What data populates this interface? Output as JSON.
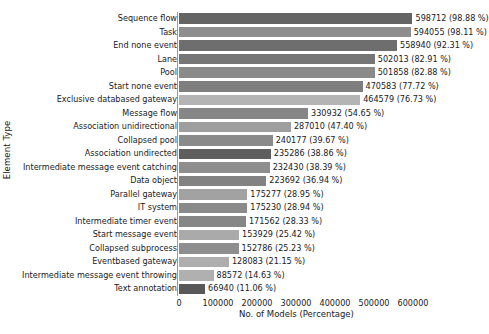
{
  "chart_data": {
    "type": "bar",
    "orientation": "horizontal",
    "title": "",
    "xlabel": "No. of Models (Percentage)",
    "ylabel": "Element Type",
    "xlim": [
      0,
      640000
    ],
    "xticks": [
      0,
      100000,
      200000,
      300000,
      400000,
      500000,
      600000
    ],
    "xticklabels": [
      "0",
      "100000",
      "200000",
      "300000",
      "400000",
      "500000",
      "600000"
    ],
    "grid": false,
    "legend": false,
    "categories": [
      "Sequence flow",
      "Task",
      "End none event",
      "Lane",
      "Pool",
      "Start none event",
      "Exclusive  databased  gateway",
      "Message flow",
      "Association  unidirectional",
      "Collapsed pool",
      "Association  undirected",
      "Intermediate message event catching",
      "Data object",
      "Parallel gateway",
      "IT system",
      "Intermediate timer event",
      "Start message event",
      "Collapsed subprocess",
      "Eventbased gateway",
      "Intermediate message event throwing",
      "Text annotation"
    ],
    "values": [
      598712,
      594055,
      558940,
      502013,
      501858,
      470583,
      464579,
      330932,
      287010,
      240177,
      235286,
      232430,
      223692,
      175277,
      175230,
      171562,
      153929,
      152786,
      128083,
      88572,
      66940
    ],
    "percentages": [
      98.88,
      98.11,
      92.31,
      82.91,
      82.88,
      77.72,
      76.73,
      54.65,
      47.4,
      39.67,
      38.86,
      38.39,
      36.94,
      28.95,
      28.94,
      28.33,
      25.42,
      25.23,
      21.15,
      14.63,
      11.06
    ],
    "data_labels": [
      "598712 (98.88 %)",
      "594055 (98.11 %)",
      "558940 (92.31 %)",
      "502013 (82.91 %)",
      "501858 (82.88 %)",
      "470583 (77.72 %)",
      "464579 (76.73 %)",
      "330932 (54.65 %)",
      "287010 (47.40 %)",
      "240177 (39.67 %)",
      "235286 (38.86 %)",
      "232430 (38.39 %)",
      "223692 (36.94 %)",
      "175277 (28.95 %)",
      "175230 (28.94 %)",
      "171562 (28.33 %)",
      "153929 (25.42 %)",
      "152786 (25.23 %)",
      "128083 (21.15 %)",
      "88572 (14.63 %)",
      "66940 (11.06 %)"
    ],
    "bar_colors": [
      "#646464",
      "#8e8e8e",
      "#6e6e6e",
      "#767676",
      "#8a8a8a",
      "#7e7e7e",
      "#b4b4b4",
      "#868686",
      "#9e9e9e",
      "#8a8a8a",
      "#5e5e5e",
      "#8e8e8e",
      "#828282",
      "#a2a2a2",
      "#8a8a8a",
      "#868686",
      "#aaaaaa",
      "#8e8e8e",
      "#aeaeae",
      "#b0b0b0",
      "#585858"
    ]
  }
}
